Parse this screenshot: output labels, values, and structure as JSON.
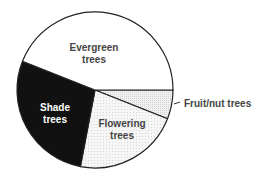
{
  "chart_data": {
    "type": "pie",
    "title": "",
    "categories": [
      "Evergreen trees",
      "Shade trees",
      "Flowering trees",
      "Fruit/nut trees"
    ],
    "values": [
      44,
      28,
      22,
      6
    ],
    "unit": "percent (estimated from slice angles)",
    "colors": {
      "Evergreen trees": "#ffffff",
      "Shade trees": "#111111",
      "Flowering trees": "#f3f3f3",
      "Fruit/nut trees": "#ebebeb"
    },
    "legend": "none (labels placed inside slices; Fruit/nut trees labeled outside with leader line)"
  },
  "labels": {
    "evergreen_line1": "Evergreen",
    "evergreen_line2": "trees",
    "shade_line1": "Shade",
    "shade_line2": "trees",
    "flowering_line1": "Flowering",
    "flowering_line2": "trees",
    "fruit": "Fruit/nut trees"
  }
}
